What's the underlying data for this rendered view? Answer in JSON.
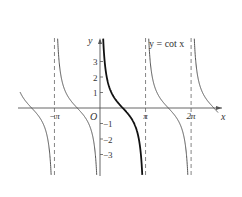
{
  "chart_data": {
    "type": "line",
    "title": "",
    "function": "y = cot x",
    "curve_label": "y = cot x",
    "xlabel": "x",
    "ylabel": "y",
    "origin_label": "O",
    "x_ticks": [
      {
        "label": "−π",
        "value": -3.14159
      },
      {
        "label": "π",
        "value": 3.14159
      },
      {
        "label": "2π",
        "value": 6.28319
      }
    ],
    "y_ticks": [
      {
        "label": "3",
        "value": 3
      },
      {
        "label": "2",
        "value": 2
      },
      {
        "label": "1",
        "value": 1
      },
      {
        "label": "−1",
        "value": -1
      },
      {
        "label": "−2",
        "value": -2
      },
      {
        "label": "−3",
        "value": -3
      }
    ],
    "asymptotes": [
      "x = −π",
      "x = 0",
      "x = π",
      "x = 2π"
    ],
    "highlighted_branch": {
      "from": "0",
      "to": "π"
    },
    "xlim": [
      -4.71,
      7.85
    ],
    "ylim": [
      -4.5,
      4.5
    ],
    "grid": false,
    "legend": "none"
  },
  "axes": {
    "origin_px": [
      100,
      108
    ],
    "px_per_unit_x": 14.5,
    "px_per_unit_y": 15.5
  },
  "colors": {
    "curve": "#444444",
    "highlight": "#111111",
    "axis": "#555555",
    "asymptote": "#666666"
  }
}
